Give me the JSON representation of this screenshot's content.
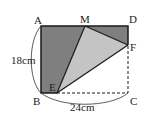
{
  "diagram": {
    "type": "geometry-figure",
    "points": {
      "A": {
        "label": "A",
        "x": 41,
        "y": 26
      },
      "D": {
        "label": "D",
        "x": 128,
        "y": 26
      },
      "M": {
        "label": "M",
        "x": 85,
        "y": 26
      },
      "F": {
        "label": "F",
        "x": 128,
        "y": 45
      },
      "E": {
        "label": "E",
        "x": 57,
        "y": 93
      },
      "B": {
        "label": "B",
        "x": 41,
        "y": 93
      },
      "C": {
        "label": "C",
        "x": 128,
        "y": 93
      }
    },
    "dimensions": {
      "height_label": "18cm",
      "width_label": "24cm"
    },
    "colors": {
      "dark_fill": "#7f7f7f",
      "light_fill": "#c4c4c4",
      "stroke": "#1a1a1a"
    }
  }
}
